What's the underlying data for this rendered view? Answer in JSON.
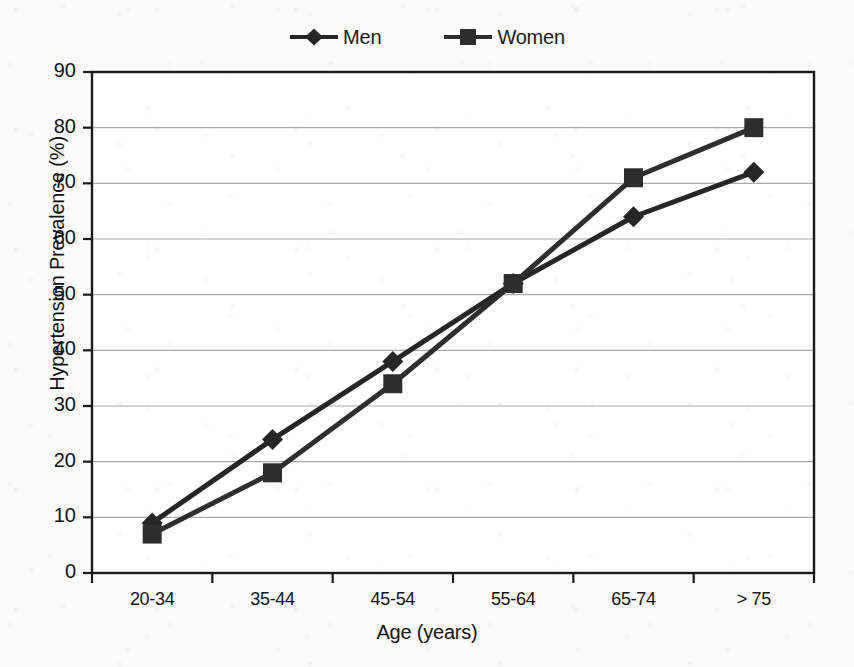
{
  "chart_data": {
    "type": "line",
    "title": "",
    "xlabel": "Age (years)",
    "ylabel": "Hypertension Prevalence (%)",
    "categories": [
      "20-34",
      "35-44",
      "45-54",
      "55-64",
      "65-74",
      "> 75"
    ],
    "series": [
      {
        "name": "Men",
        "marker": "diamond",
        "values": [
          9,
          24,
          38,
          52,
          64,
          72
        ]
      },
      {
        "name": "Women",
        "marker": "square",
        "values": [
          7,
          18,
          34,
          52,
          71,
          80
        ]
      }
    ],
    "ylim": [
      0,
      90
    ],
    "ytick_step": 10,
    "yticks": [
      0,
      10,
      20,
      30,
      40,
      50,
      60,
      70,
      80,
      90
    ],
    "ytick_labels": [
      "0",
      "10",
      "20",
      "30",
      "40",
      "50",
      "60",
      "70",
      "80",
      "90"
    ],
    "grid": "horizontal",
    "legend_position": "top-center",
    "colors": {
      "series_men": "#262626",
      "series_women": "#2e2e2e",
      "gridline": "#aaaaaa",
      "axis": "#1a1a1a",
      "plot_background": "#ffffff",
      "page_background": "#fbfbfb"
    }
  },
  "legend": {
    "entries": [
      {
        "label": "Men"
      },
      {
        "label": "Women"
      }
    ]
  }
}
